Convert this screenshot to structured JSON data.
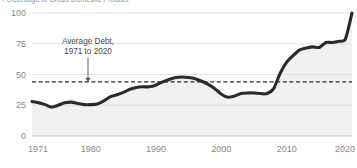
{
  "subtitle": "Percentage of Gross Domestic Product",
  "annotation": {
    "line1": "Average Debt,",
    "line2": "1971 to 2020",
    "value": 44,
    "icon": "down-arrow-icon"
  },
  "chart_data": {
    "type": "area",
    "title": "",
    "subtitle": "Percentage of Gross Domestic Product",
    "xlabel": "",
    "ylabel": "",
    "xlim": [
      1971,
      2020
    ],
    "ylim": [
      0,
      100
    ],
    "yticks": [
      0,
      25,
      50,
      75,
      100
    ],
    "ytick_labels": [
      "0",
      "25",
      "50",
      "75",
      "100"
    ],
    "xticks": [
      1971,
      1980,
      1990,
      2000,
      2010,
      2020
    ],
    "xtick_labels": [
      "1971",
      "1980",
      "1990",
      "2000",
      "2010",
      "2020"
    ],
    "grid": true,
    "legend": "none",
    "annotations": [
      {
        "text": "Average Debt, 1971 to 2020",
        "type": "reference-line",
        "y": 44,
        "style": "dashed"
      }
    ],
    "series": [
      {
        "name": "Federal Debt Held by the Public",
        "x": [
          1971,
          1972,
          1973,
          1974,
          1975,
          1976,
          1977,
          1978,
          1979,
          1980,
          1981,
          1982,
          1983,
          1984,
          1985,
          1986,
          1987,
          1988,
          1989,
          1990,
          1991,
          1992,
          1993,
          1994,
          1995,
          1996,
          1997,
          1998,
          1999,
          2000,
          2001,
          2002,
          2003,
          2004,
          2005,
          2006,
          2007,
          2008,
          2009,
          2010,
          2011,
          2012,
          2013,
          2014,
          2015,
          2016,
          2017,
          2018,
          2019,
          2020
        ],
        "values": [
          28,
          27,
          25.5,
          23.5,
          25,
          27,
          27.5,
          26.5,
          25.5,
          25.5,
          26,
          28.5,
          32,
          33.5,
          35.5,
          38,
          39.5,
          40,
          40,
          41.5,
          44,
          46,
          47.5,
          48,
          47.5,
          46.5,
          44.5,
          42,
          38.5,
          34,
          31.5,
          32.5,
          34.5,
          35,
          35,
          34.5,
          34.5,
          38.5,
          51,
          60,
          65.5,
          70,
          71.5,
          72.5,
          72,
          76,
          76,
          77,
          79,
          100
        ]
      }
    ]
  }
}
